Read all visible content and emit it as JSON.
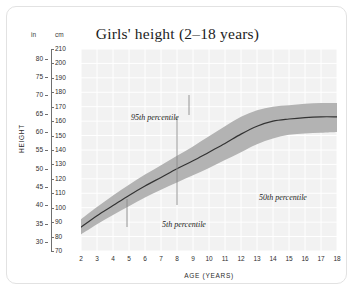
{
  "card": {
    "title": "Girls' height (2–18 years)"
  },
  "axes": {
    "unit_left_label": "in",
    "unit_right_label": "cm",
    "y_axis_title": "HEIGHT",
    "x_axis_title": "AGE (YEARS)",
    "cm_ticks": [
      70,
      80,
      90,
      100,
      110,
      120,
      130,
      140,
      150,
      160,
      170,
      180,
      190,
      200,
      210
    ],
    "in_ticks": [
      30,
      35,
      40,
      45,
      50,
      55,
      60,
      65,
      70,
      75,
      80
    ],
    "x_ticks": [
      2,
      3,
      4,
      5,
      6,
      7,
      8,
      9,
      10,
      11,
      12,
      13,
      14,
      15,
      16,
      17,
      18
    ]
  },
  "annotations": {
    "p95": "95th percentile",
    "p50": "50th percentile",
    "p5": "5th percentile"
  },
  "colors": {
    "plot_background": "#f2f2f2",
    "gridline": "#ffffff",
    "band": "#b3b3b3",
    "median_line": "#333333",
    "leader_line": "#8a8a8a",
    "card_border": "#e2e2e2"
  },
  "chart_data": {
    "type": "line",
    "title": "Girls' height (2–18 years)",
    "xlabel": "AGE (YEARS)",
    "ylabel": "HEIGHT",
    "xlim": [
      2,
      18
    ],
    "ylim": [
      70,
      210
    ],
    "y_unit_primary": "cm",
    "y_unit_secondary": "in",
    "grid": true,
    "legend": "annotated inline",
    "x": [
      2,
      3,
      4,
      5,
      6,
      7,
      8,
      9,
      10,
      11,
      12,
      13,
      14,
      15,
      16,
      17,
      18
    ],
    "series": [
      {
        "name": "5th percentile",
        "values": [
          81.5,
          88.5,
          95.0,
          101.0,
          107.0,
          112.5,
          117.5,
          122.5,
          127.5,
          133.0,
          138.5,
          144.0,
          148.0,
          150.5,
          151.5,
          152.0,
          152.5
        ]
      },
      {
        "name": "50th percentile",
        "values": [
          86.5,
          94.5,
          101.5,
          108.5,
          115.0,
          121.0,
          127.0,
          132.5,
          138.5,
          144.5,
          151.0,
          156.5,
          160.0,
          161.5,
          162.5,
          163.0,
          163.0
        ]
      },
      {
        "name": "95th percentile",
        "values": [
          92.0,
          100.5,
          108.5,
          116.0,
          123.0,
          129.5,
          136.0,
          142.5,
          149.5,
          156.5,
          163.0,
          167.5,
          170.0,
          171.0,
          172.0,
          172.5,
          172.5
        ]
      }
    ]
  }
}
